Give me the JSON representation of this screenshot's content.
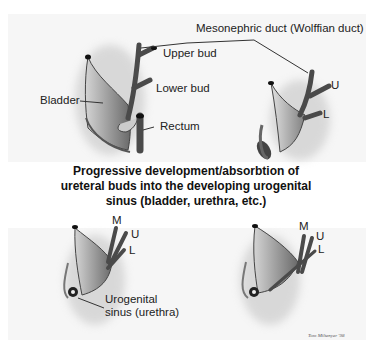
{
  "diagram": {
    "title_lines": [
      "Progressive development/absorbtion of",
      "ureteral buds into the developing urogenital",
      "sinus (bladder, urethra, etc.)"
    ],
    "labels": {
      "mesonephric": "Mesonephric duct (Wolffian duct)",
      "upper_bud": "Upper bud",
      "lower_bud": "Lower bud",
      "bladder": "Bladder",
      "rectum": "Rectum",
      "stage2_u": "U",
      "stage2_l": "L",
      "stage3_m": "M",
      "stage3_u": "U",
      "stage3_l": "L",
      "urogenital_1": "Urogenital",
      "urogenital_2": "sinus (urethra)",
      "stage4_m": "M",
      "stage4_u": "U",
      "stage4_l": "L"
    },
    "credit": "Tom Miltenyer '98",
    "colors": {
      "tissue_light": "#c8c8c8",
      "tissue_dark": "#5a5a5a",
      "duct": "#4a4a4a",
      "text": "#222222"
    }
  }
}
